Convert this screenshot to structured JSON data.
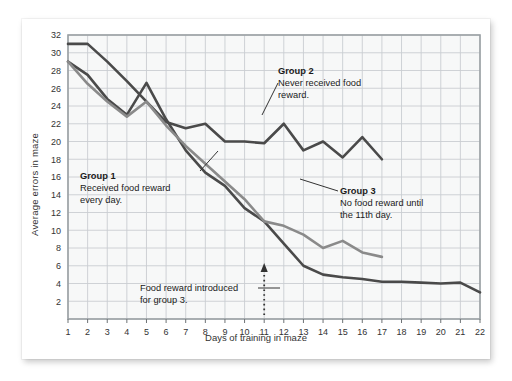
{
  "chart_data": {
    "type": "line",
    "title": "",
    "xlabel": "Days of training in maze",
    "ylabel": "Average errors in maze",
    "xlim": [
      1,
      22
    ],
    "ylim": [
      0,
      32
    ],
    "ytick_step": 2,
    "grid": true,
    "legend_position": "inline-annotations",
    "xticks": [
      "1",
      "2",
      "3",
      "4",
      "5",
      "6",
      "7",
      "8",
      "9",
      "10",
      "11",
      "12",
      "13",
      "14",
      "15",
      "16",
      "17",
      "18",
      "19",
      "20",
      "21",
      "22"
    ],
    "yticks": [
      "2",
      "4",
      "6",
      "8",
      "10",
      "12",
      "14",
      "16",
      "18",
      "20",
      "22",
      "24",
      "26",
      "28",
      "30",
      "32"
    ],
    "series": [
      {
        "name": "Group 1",
        "color": "#4a4a4a",
        "x": [
          1,
          2,
          3,
          4,
          5,
          6,
          7,
          8,
          9,
          10,
          11,
          12,
          13,
          14,
          15,
          16,
          17,
          18,
          19,
          20,
          21,
          22
        ],
        "values": [
          29,
          27.5,
          24.8,
          23,
          26.6,
          22.5,
          19,
          16.5,
          15,
          12.5,
          11,
          8.5,
          6,
          5,
          4.7,
          4.5,
          4.2,
          4.2,
          4.1,
          4,
          4.1,
          3
        ]
      },
      {
        "name": "Group 2",
        "color": "#4a4a4a",
        "x": [
          1,
          2,
          3,
          4,
          5,
          6,
          7,
          8,
          9,
          10,
          11,
          12,
          13,
          14,
          15,
          16,
          17
        ],
        "values": [
          31,
          31,
          29,
          26.8,
          24.5,
          22.2,
          21.5,
          22,
          20,
          20,
          19.8,
          22,
          19,
          20,
          18.2,
          20.5,
          18
        ]
      },
      {
        "name": "Group 3",
        "color": "#8a8a8a",
        "x": [
          1,
          2,
          3,
          4,
          5,
          6,
          7,
          8,
          9,
          10,
          11,
          12,
          13,
          14,
          15,
          16,
          17
        ],
        "values": [
          29,
          26.5,
          24.5,
          22.8,
          24.5,
          21.8,
          19.5,
          17.5,
          15.5,
          13.5,
          11,
          10.5,
          9.5,
          8,
          8.8,
          7.5,
          7
        ]
      }
    ],
    "annotations": [
      {
        "id": "group1",
        "title": "Group 1",
        "lines": [
          "Received food reward",
          "every day."
        ],
        "leader": "diagonal-up-right"
      },
      {
        "id": "group2",
        "title": "Group 2",
        "lines": [
          "Never received food",
          "reward."
        ],
        "leader": "diagonal-down-left"
      },
      {
        "id": "group3",
        "title": "Group 3",
        "lines": [
          "No food reward until",
          "the 11th day."
        ],
        "leader": "diagonal-up-left"
      },
      {
        "id": "reward-intro",
        "title": "",
        "lines": [
          "Food reward introduced",
          "for group 3."
        ],
        "leader": "dotted-arrow-to-day-11",
        "marker_day": 11
      }
    ]
  },
  "axes": {
    "ylabel": "Average errors in maze",
    "xlabel": "Days of training in maze"
  },
  "annotations": {
    "group1": {
      "title": "Group 1",
      "line1": "Received food reward",
      "line2": "every day."
    },
    "group2": {
      "title": "Group 2",
      "line1": "Never received food",
      "line2": "reward."
    },
    "group3": {
      "title": "Group 3",
      "line1": "No food reward until",
      "line2": "the 11th day."
    },
    "reward": {
      "line1": "Food reward introduced",
      "line2": "for group 3."
    }
  },
  "colors": {
    "dark_line": "#4a4a4a",
    "gray_line": "#8a8a8a",
    "grid": "#c9cdd1",
    "plot_bg": "#f7f8f8",
    "frame": "#9aa0a4"
  }
}
